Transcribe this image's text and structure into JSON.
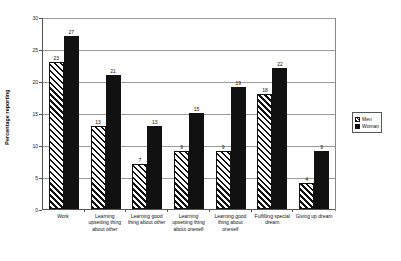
{
  "chart_data": {
    "type": "bar",
    "title": "",
    "xlabel": "",
    "ylabel": "Percentage reporting",
    "ylim": [
      0,
      30
    ],
    "yticks": [
      0,
      5,
      10,
      15,
      20,
      25,
      30
    ],
    "grid": true,
    "legend_position": "right",
    "categories": [
      "Work",
      "Learning upsetting thing about other",
      "Learning good thing about other",
      "Learning upsetting thing about oneself",
      "Learning good thing about oneself",
      "Fulfilling special dream",
      "Giving up dream"
    ],
    "category_lines": [
      [
        "Work"
      ],
      [
        "Learning",
        "upsetting thing",
        "about other"
      ],
      [
        "Learning good",
        "thing about other"
      ],
      [
        "Learning",
        "upsetting thing",
        "about oneself"
      ],
      [
        "Learning good",
        "thing about",
        "oneself"
      ],
      [
        "Fulfilling special",
        "dream"
      ],
      [
        "Giving up dream"
      ]
    ],
    "series": [
      {
        "name": "Men",
        "color": "#ffffff",
        "pattern": "diagonal-hatch",
        "values": [
          23,
          13,
          7,
          9,
          9,
          18,
          4
        ]
      },
      {
        "name": "Woman",
        "color": "#111111",
        "pattern": "solid",
        "values": [
          27,
          21,
          13,
          15,
          19,
          22,
          9
        ]
      }
    ]
  },
  "legend": {
    "items": [
      {
        "label": "Men"
      },
      {
        "label": "Woman"
      }
    ]
  }
}
